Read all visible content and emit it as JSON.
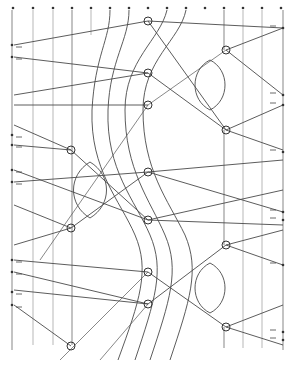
{
  "diagram": {
    "type": "lace-pricking-diagram",
    "colors": {
      "line": "#4a4a4a",
      "background": "#ffffff",
      "pin": "#333333"
    },
    "top_pins_x": [
      13,
      33,
      53,
      72,
      91,
      110,
      129,
      148,
      167,
      186,
      205,
      224,
      243,
      262,
      281
    ],
    "left_border_pins_y": [
      45,
      57,
      135,
      145,
      170,
      182,
      260,
      272,
      292,
      305
    ],
    "right_border_pins_y": [
      28,
      95,
      105,
      152,
      212,
      220,
      265,
      332,
      340
    ],
    "circles": [
      {
        "x": 148,
        "y": 21
      },
      {
        "x": 226,
        "y": 50
      },
      {
        "x": 148,
        "y": 73
      },
      {
        "x": 148,
        "y": 105
      },
      {
        "x": 226,
        "y": 130
      },
      {
        "x": 71,
        "y": 150
      },
      {
        "x": 148,
        "y": 172
      },
      {
        "x": 148,
        "y": 220
      },
      {
        "x": 71,
        "y": 228
      },
      {
        "x": 226,
        "y": 245
      },
      {
        "x": 148,
        "y": 272
      },
      {
        "x": 148,
        "y": 304
      },
      {
        "x": 226,
        "y": 327
      },
      {
        "x": 71,
        "y": 346
      }
    ],
    "lenses": [
      {
        "cx": 210,
        "cy": 85,
        "rx": 15,
        "ry": 25
      },
      {
        "cx": 90,
        "cy": 190,
        "rx": 16,
        "ry": 28
      },
      {
        "cx": 210,
        "cy": 288,
        "rx": 15,
        "ry": 25
      }
    ]
  }
}
